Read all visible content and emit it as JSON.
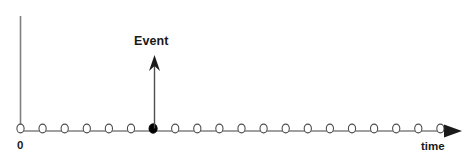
{
  "figure": {
    "kind": "timeline-diagram",
    "width": 471,
    "height": 163,
    "background_color": "#ffffff",
    "line_color": "#808080",
    "marker_stroke_color": "#4d4d4d",
    "text_color": "#1a1a1a",
    "event_color": "#000000"
  },
  "labels": {
    "origin": "0",
    "time_axis": "time",
    "event": "Event"
  },
  "axes": {
    "vertical": {
      "x": 20.5,
      "y_top": 16,
      "y_bottom": 131,
      "stroke_width": 1.6
    },
    "horizontal": {
      "y": 131,
      "x_start": 20.5,
      "x_end": 446,
      "stroke_width": 1.6,
      "arrowhead": {
        "tip_x": 462,
        "back_x": 444,
        "half_height": 6.5
      }
    }
  },
  "markers": {
    "count": 20,
    "first_x": 20.5,
    "spacing": 22.1,
    "y": 128.5,
    "radius_x": 3.6,
    "radius_y": 4.4,
    "open_fill": "#ffffff",
    "filled_index": 6,
    "filled_fill": "#000000"
  },
  "event_arrow": {
    "x": 154.5,
    "y_base": 128.5,
    "y_tip": 55,
    "stroke_width": 1.4,
    "head_half_width": 5.5,
    "head_height": 16
  },
  "label_positions": {
    "event": {
      "left": 134,
      "top": 35
    },
    "origin": {
      "left": 17,
      "top": 140
    },
    "time": {
      "left": 421,
      "top": 141
    }
  }
}
